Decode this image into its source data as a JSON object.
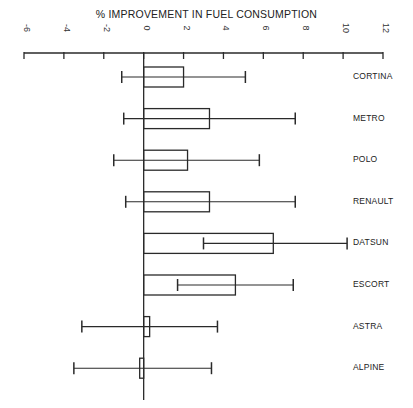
{
  "chart_data": {
    "type": "bar",
    "title": "% IMPROVEMENT IN FUEL CONSUMPTION",
    "xlabel": "% IMPROVEMENT IN FUEL CONSUMPTION",
    "ylabel": "",
    "orientation": "horizontal",
    "xlim": [
      -6,
      12
    ],
    "x_ticks": [
      -6,
      -4,
      -2,
      0,
      2,
      4,
      6,
      8,
      10,
      12
    ],
    "grid": false,
    "legend": null,
    "categories": [
      "CORTINA",
      "METRO",
      "POLO",
      "RENAULT",
      "DATSUN",
      "ESCORT",
      "ASTRA",
      "ALPINE"
    ],
    "values": [
      2.0,
      3.3,
      2.2,
      3.3,
      6.5,
      4.6,
      0.3,
      -0.2
    ],
    "error_low": [
      -1.1,
      -1.0,
      -1.5,
      -0.9,
      3.0,
      1.7,
      -3.1,
      -3.5
    ],
    "error_high": [
      5.1,
      7.6,
      5.8,
      7.6,
      10.2,
      7.5,
      3.7,
      3.4
    ]
  }
}
